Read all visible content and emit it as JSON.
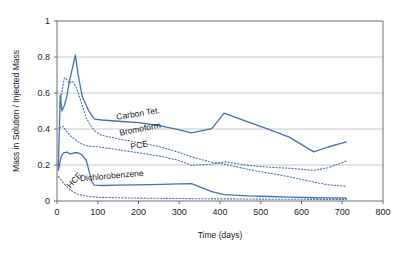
{
  "chart_data": {
    "type": "line",
    "title": "",
    "xlabel": "Time (days)",
    "ylabel": "Mass in Solution / Injected Mass",
    "xlim": [
      0,
      800
    ],
    "ylim": [
      0,
      1
    ],
    "xticks": [
      "0",
      "100",
      "200",
      "300",
      "400",
      "500",
      "600",
      "700",
      "800"
    ],
    "yticks": [
      "0",
      "0.2",
      "0.4",
      "0.6",
      "0.8",
      "1"
    ],
    "grid": "horizontal",
    "legend_position": "inline-annotations",
    "line_color": "#4472ac",
    "series": [
      {
        "name": "Carbon Tet.",
        "style": "solid",
        "label_x": 200,
        "label_y": 0.47,
        "label_rotation": -9,
        "x": [
          3,
          8,
          12,
          18,
          24,
          30,
          38,
          45,
          52,
          62,
          78,
          92,
          110,
          150,
          200,
          255,
          300,
          330,
          380,
          410,
          470,
          520,
          570,
          630,
          665,
          710
        ],
        "y": [
          0.17,
          0.59,
          0.5,
          0.53,
          0.58,
          0.66,
          0.74,
          0.81,
          0.7,
          0.58,
          0.5,
          0.455,
          0.45,
          0.443,
          0.435,
          0.418,
          0.395,
          0.378,
          0.402,
          0.488,
          0.438,
          0.398,
          0.355,
          0.273,
          0.3,
          0.328
        ]
      },
      {
        "name": "Bromoform",
        "style": "dotted",
        "label_x": 205,
        "label_y": 0.385,
        "label_rotation": -11,
        "x": [
          6,
          12,
          18,
          24,
          30,
          38,
          45,
          52,
          62,
          72,
          85,
          95,
          110,
          150,
          200,
          255,
          300,
          330,
          380,
          410,
          470,
          520,
          570,
          630,
          665,
          710
        ],
        "y": [
          0.52,
          0.6,
          0.685,
          0.675,
          0.655,
          0.665,
          0.64,
          0.6,
          0.53,
          0.46,
          0.41,
          0.385,
          0.365,
          0.345,
          0.325,
          0.3,
          0.27,
          0.245,
          0.215,
          0.205,
          0.175,
          0.155,
          0.135,
          0.105,
          0.09,
          0.082
        ]
      },
      {
        "name": "PCE",
        "style": "dotted",
        "label_x": 203,
        "label_y": 0.295,
        "label_rotation": -10,
        "x": [
          6,
          14,
          24,
          36,
          48,
          62,
          78,
          92,
          110,
          150,
          200,
          255,
          300,
          330,
          380,
          410,
          470,
          520,
          570,
          630,
          665,
          710
        ],
        "y": [
          0.405,
          0.415,
          0.385,
          0.355,
          0.335,
          0.315,
          0.305,
          0.303,
          0.298,
          0.285,
          0.268,
          0.248,
          0.225,
          0.198,
          0.205,
          0.218,
          0.198,
          0.188,
          0.182,
          0.17,
          0.185,
          0.222
        ]
      },
      {
        "name": "Dichlorobenzene",
        "style": "solid",
        "label_x": 135,
        "label_y": 0.125,
        "label_rotation": -5,
        "x": [
          4,
          10,
          16,
          24,
          32,
          42,
          52,
          62,
          72,
          80,
          86,
          92,
          110,
          150,
          200,
          255,
          300,
          330,
          380,
          410,
          470,
          520,
          570,
          630,
          665,
          710
        ],
        "y": [
          0.175,
          0.245,
          0.268,
          0.272,
          0.262,
          0.268,
          0.268,
          0.255,
          0.225,
          0.155,
          0.105,
          0.088,
          0.086,
          0.088,
          0.09,
          0.092,
          0.095,
          0.097,
          0.052,
          0.035,
          0.028,
          0.025,
          0.022,
          0.018,
          0.017,
          0.016
        ]
      },
      {
        "name": "HCE",
        "style": "dotted",
        "label_x": 48,
        "label_y": 0.105,
        "label_rotation": -48,
        "x": [
          4,
          14,
          26,
          40,
          55,
          70,
          85,
          95,
          110,
          150,
          200,
          255,
          300,
          330,
          380,
          410,
          470,
          520,
          570,
          630,
          665,
          710
        ],
        "y": [
          0.135,
          0.105,
          0.075,
          0.05,
          0.035,
          0.028,
          0.024,
          0.022,
          0.02,
          0.018,
          0.016,
          0.015,
          0.014,
          0.013,
          0.012,
          0.012,
          0.011,
          0.01,
          0.01,
          0.009,
          0.009,
          0.009
        ]
      }
    ]
  },
  "axes": {
    "y_title": "Mass in Solution / Injected Mass",
    "x_title": "Time (days)"
  }
}
